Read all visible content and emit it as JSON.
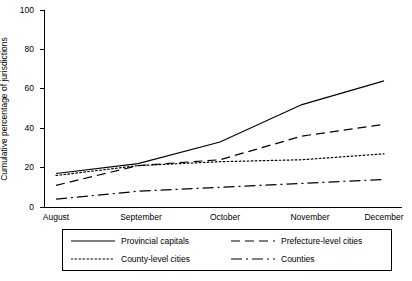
{
  "chart_data": {
    "type": "line",
    "title": "",
    "xlabel": "",
    "ylabel": "Cumulative percentage of jurisdictions",
    "ylim": [
      0,
      100
    ],
    "yticks": [
      0,
      20,
      40,
      60,
      80,
      100
    ],
    "categories": [
      "August",
      "September",
      "October",
      "November",
      "December"
    ],
    "grid": false,
    "legend_position": "bottom",
    "series": [
      {
        "name": "Provincial capitals",
        "style": "solid",
        "color": "#000000",
        "values": [
          17,
          22,
          33,
          52,
          64
        ]
      },
      {
        "name": "Prefecture-level cities",
        "style": "long-dash",
        "color": "#000000",
        "values": [
          11,
          21,
          24,
          36,
          42
        ]
      },
      {
        "name": "County-level cities",
        "style": "dotted",
        "color": "#000000",
        "values": [
          16,
          21,
          23,
          24,
          27
        ]
      },
      {
        "name": "Counties",
        "style": "dash-dot",
        "color": "#000000",
        "values": [
          4,
          8,
          10,
          12,
          14
        ]
      }
    ]
  },
  "axis": {
    "y_title": "Cumulative percentage of jurisdictions",
    "y_tick_labels": [
      "0",
      "20",
      "40",
      "60",
      "80",
      "100"
    ],
    "x_tick_labels": [
      "August",
      "September",
      "October",
      "November",
      "December"
    ]
  },
  "legend": {
    "items": [
      {
        "label": "Provincial capitals"
      },
      {
        "label": "Prefecture-level cities"
      },
      {
        "label": "County-level cities"
      },
      {
        "label": "Counties"
      }
    ]
  }
}
